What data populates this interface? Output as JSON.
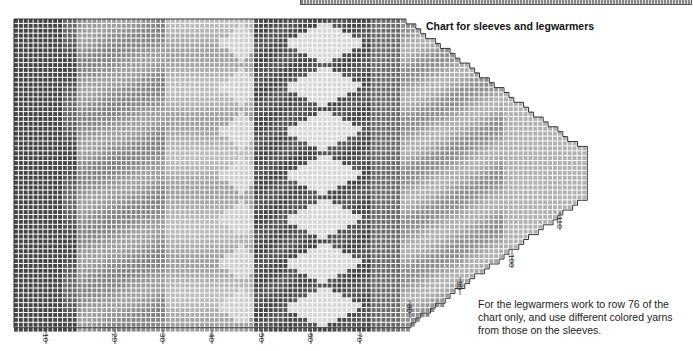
{
  "title": "Chart for sleeves and legwarmers",
  "note": "For the legwarmers work to row 76 of the chart only, and use different colored yarns from those on the sleeves.",
  "chart": {
    "type": "knitting-colorwork-grid",
    "row_labels": [
      "10",
      "20",
      "30",
      "40",
      "50",
      "60",
      "70",
      "80",
      "90",
      "100",
      "110"
    ],
    "bottom_label_x": [
      46,
      115,
      163,
      212,
      262,
      311,
      360
    ],
    "taper_labels": [
      {
        "label": "80",
        "x": 410,
        "y": 318
      },
      {
        "label": "90",
        "x": 460,
        "y": 295
      },
      {
        "label": "100",
        "x": 512,
        "y": 268
      },
      {
        "label": "110",
        "x": 560,
        "y": 230
      }
    ],
    "colors": {
      "darkest": "#3a3a3a",
      "dark": "#5c5c5c",
      "mid": "#8c8c8c",
      "light": "#b8b8b8",
      "lightest": "#e2e2e2",
      "grid": "#f4f4f4",
      "outline": "#333333"
    }
  }
}
